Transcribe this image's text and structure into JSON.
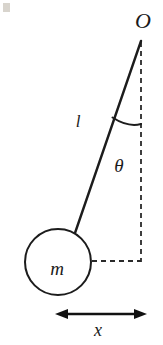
{
  "figure": {
    "background_color": "#ffffff",
    "ink_color": "#1c1c1c",
    "width": 163,
    "height": 345
  },
  "labels": {
    "pivot": "O",
    "length": "l",
    "angle": "θ",
    "mass": "m",
    "displacement": "x"
  },
  "geometry": {
    "pivot_point": {
      "x": 141,
      "y": 40
    },
    "bob_center": {
      "x": 58,
      "y": 262
    },
    "bob_radius": 33,
    "rod_end": {
      "x": 75,
      "y": 233
    },
    "vertical_dashed_line": {
      "x": 141,
      "y_start": 42,
      "y_end": 262
    },
    "horizontal_dashed_line": {
      "y": 261,
      "x_start": 91,
      "x_end": 141
    },
    "angle_arc": {
      "from": {
        "x": 113,
        "y": 118
      },
      "to": {
        "x": 141,
        "y": 124
      }
    },
    "displacement_arrow": {
      "y": 314,
      "x_start": 55,
      "x_end": 147
    }
  },
  "label_positions": {
    "pivot": {
      "x": 143,
      "y": 22
    },
    "length": {
      "x": 78,
      "y": 123
    },
    "angle": {
      "x": 119,
      "y": 168
    },
    "mass": {
      "x": 57,
      "y": 270
    },
    "displacement": {
      "x": 98,
      "y": 331
    }
  }
}
